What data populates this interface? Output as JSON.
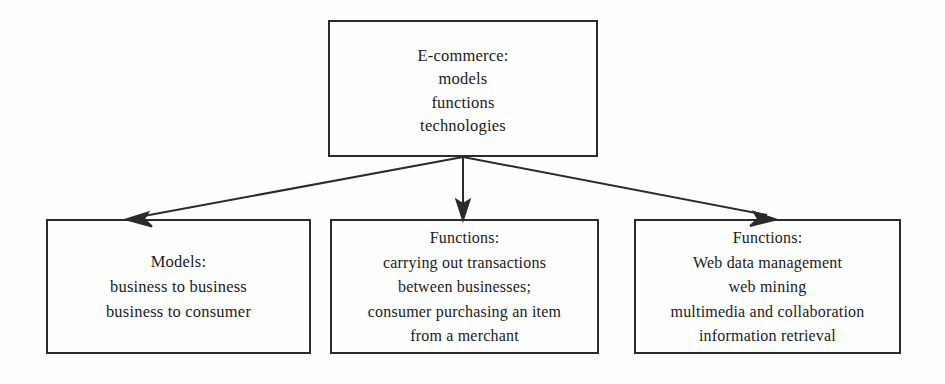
{
  "diagram": {
    "background_color": "#fefefe",
    "stroke_color": "#2b2b2b",
    "text_color": "#1a1a1a",
    "nodes": {
      "root": {
        "lines": [
          "E-commerce:",
          "models",
          "functions",
          "technologies"
        ]
      },
      "models": {
        "lines": [
          "Models:",
          "business to business",
          "business to consumer"
        ]
      },
      "functions_transactions": {
        "lines": [
          "Functions:",
          "carrying out transactions",
          "between businesses;",
          "consumer purchasing an item",
          "from a merchant"
        ]
      },
      "functions_web": {
        "lines": [
          "Functions:",
          "Web data management",
          "web mining",
          "multimedia and collaboration",
          "information retrieval"
        ]
      }
    },
    "connectors": [
      {
        "name": "root-to-models",
        "from": "root",
        "to": "models",
        "direction": "down-left"
      },
      {
        "name": "root-to-functions-transactions",
        "from": "root",
        "to": "functions_transactions",
        "direction": "down"
      },
      {
        "name": "root-to-functions-web",
        "from": "root",
        "to": "functions_web",
        "direction": "down-right"
      }
    ]
  }
}
